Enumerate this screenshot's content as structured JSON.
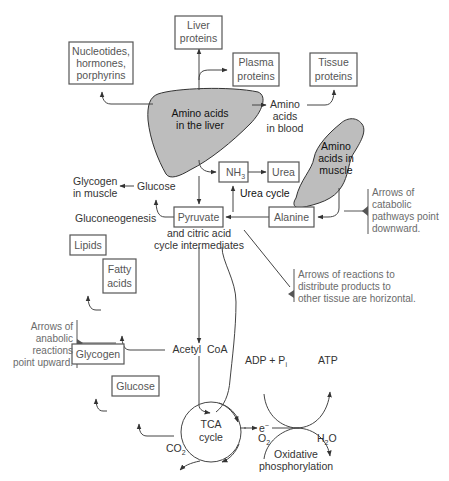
{
  "diagram": {
    "boxes": {
      "liver_proteins": [
        "Liver",
        "proteins"
      ],
      "nucleotides": [
        "Nucleotides,",
        "hormones,",
        "porphyrins"
      ],
      "plasma_proteins": [
        "Plasma",
        "proteins"
      ],
      "tissue_proteins": [
        "Tissue",
        "proteins"
      ],
      "nh3": "NH",
      "nh3_sub": "3",
      "urea": "Urea",
      "pyruvate": "Pyruvate",
      "alanine": "Alanine",
      "lipids": "Lipids",
      "fatty_acids": [
        "Fatty",
        "acids"
      ],
      "glycogen": "Glycogen",
      "glucose": "Glucose"
    },
    "shapes": {
      "liver": [
        "Amino acids",
        "in the liver"
      ],
      "muscle": [
        "Amino",
        "acids in",
        "muscle"
      ]
    },
    "labels": {
      "amino_acids_blood": [
        "Amino",
        "acids",
        "in blood"
      ],
      "glycogen_muscle": [
        "Glycogen",
        "in muscle"
      ],
      "glucose_free": "Glucose",
      "gluconeogenesis": "Gluconeogenesis",
      "urea_cycle": "Urea cycle",
      "pyruvate_sub": [
        "and citric acid",
        "cycle intermediates"
      ],
      "acetyl_coa": "Acetyl  CoA",
      "tca": [
        "TCA",
        "cycle"
      ],
      "co2": "CO",
      "co2_sub": "2",
      "electron": "e",
      "electron_sup": "−",
      "adp": "ADP + P",
      "adp_sub": "i",
      "atp": "ATP",
      "o2": "O",
      "o2_sub": "2",
      "h2o_h": "H",
      "h2o_sub": "2",
      "h2o_o": "O",
      "oxphos": [
        "Oxidative",
        "phosphorylation"
      ]
    },
    "notes": {
      "catabolic": [
        "Arrows of",
        "catabolic",
        "pathways point",
        "downward."
      ],
      "distribute": [
        "Arrows of reactions to",
        "distribute products to",
        "other tissue are horizontal."
      ],
      "anabolic": [
        "Arrows of",
        "anabolic",
        "reactions",
        "point upward."
      ]
    },
    "colors": {
      "shape_fill": "#bdbdbd",
      "line": "#444444",
      "note_text": "#6b6b6b"
    }
  }
}
